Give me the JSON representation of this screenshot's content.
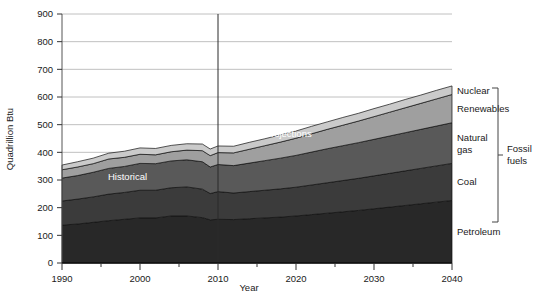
{
  "chart_data": {
    "type": "area",
    "title": "",
    "subtitle": "",
    "xlabel": "Year",
    "ylabel": "Quadrillion Btu",
    "xlim": [
      1990,
      2040
    ],
    "ylim": [
      0,
      900
    ],
    "ytick_step": 100,
    "xtick_step": 10,
    "x_minor_step": 5,
    "grid": true,
    "legend_position": "right-inline",
    "stacked": true,
    "x": [
      1990,
      1992,
      1994,
      1996,
      1998,
      2000,
      2002,
      2004,
      2006,
      2008,
      2009,
      2010,
      2012,
      2014,
      2016,
      2018,
      2020,
      2022,
      2024,
      2026,
      2028,
      2030,
      2032,
      2034,
      2036,
      2038,
      2040
    ],
    "series": [
      {
        "name": "Petroleum",
        "color": "#282828",
        "values": [
          137,
          141,
          147,
          153,
          158,
          163,
          163,
          170,
          170,
          164,
          156,
          158,
          157,
          160,
          163,
          166,
          170,
          175,
          180,
          185,
          190,
          196,
          202,
          208,
          214,
          220,
          226
        ]
      },
      {
        "name": "Coal",
        "color": "#3b3b3b",
        "values": [
          87,
          90,
          92,
          96,
          97,
          100,
          100,
          102,
          105,
          103,
          95,
          100,
          96,
          98,
          100,
          102,
          104,
          107,
          110,
          113,
          116,
          119,
          122,
          125,
          128,
          131,
          134
        ]
      },
      {
        "name": "Natural gas",
        "color": "#595959",
        "values": [
          83,
          85,
          89,
          93,
          94,
          97,
          96,
          97,
          98,
          99,
          96,
          98,
          99,
          103,
          107,
          111,
          115,
          119,
          123,
          126,
          129,
          132,
          135,
          138,
          141,
          144,
          147
        ]
      },
      {
        "name": "Renewables",
        "color": "#9f9f9f",
        "values": [
          30,
          31,
          31,
          34,
          33,
          33,
          32,
          33,
          35,
          40,
          41,
          43,
          46,
          50,
          54,
          58,
          62,
          66,
          70,
          74,
          78,
          82,
          86,
          90,
          94,
          98,
          102
        ]
      },
      {
        "name": "Nuclear",
        "color": "#cacaca",
        "values": [
          17,
          19,
          20,
          21,
          22,
          23,
          23,
          23,
          23,
          24,
          24,
          24,
          24,
          25,
          25,
          26,
          26,
          27,
          27,
          28,
          28,
          29,
          29,
          30,
          30,
          31,
          31
        ]
      }
    ],
    "annotations": [
      {
        "text": "Historical",
        "x": 1998.4,
        "y": 300,
        "color": "#ffffff"
      },
      {
        "text": "Projections",
        "x": 2019.0,
        "y": 455,
        "color": "#ffffff"
      }
    ],
    "divider": {
      "x": 2010,
      "label": ""
    },
    "xticks": [
      "1990",
      "2000",
      "2010",
      "2020",
      "2030",
      "2040"
    ],
    "xtick_values": [
      1990,
      2000,
      2010,
      2020,
      2030,
      2040
    ],
    "yticks": [
      "0",
      "100",
      "200",
      "300",
      "400",
      "500",
      "600",
      "700",
      "800",
      "900"
    ],
    "ytick_values": [
      0,
      100,
      200,
      300,
      400,
      500,
      600,
      700,
      800,
      900
    ]
  },
  "legend": {
    "items": [
      {
        "label": "Nuclear",
        "line2": "",
        "color": "#cacaca"
      },
      {
        "label": "Renewables",
        "line2": "",
        "color": "#9f9f9f"
      },
      {
        "label": "Natural",
        "line2": "gas",
        "color": "#595959"
      },
      {
        "label": "Coal",
        "line2": "",
        "color": "#3b3b3b"
      },
      {
        "label": "Petroleum",
        "line2": "",
        "color": "#282828"
      }
    ],
    "bracket": {
      "label_line1": "Fossil",
      "label_line2": "fuels"
    }
  },
  "axes": {
    "x_title": "Year",
    "y_title": "Quadrillion Btu"
  }
}
